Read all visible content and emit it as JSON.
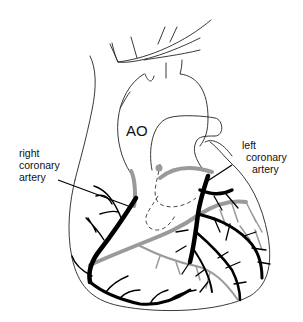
{
  "figure": {
    "type": "anatomical-diagram",
    "labels": {
      "aorta": "AO",
      "right_coronary": [
        "right",
        "coronary",
        "artery"
      ],
      "left_coronary": [
        "left",
        "coronary",
        "artery"
      ]
    },
    "colors": {
      "outline": "#222222",
      "artery": "#000000",
      "posterior_artery": "#9a9a9a",
      "background": "#ffffff"
    }
  }
}
